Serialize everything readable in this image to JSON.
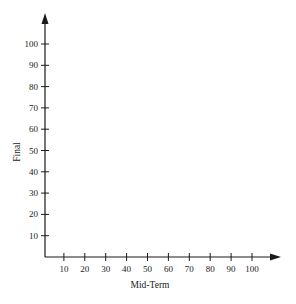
{
  "chart_data": {
    "type": "scatter",
    "title": "",
    "xlabel": "Mid-Term",
    "ylabel": "Final",
    "xlim": [
      0,
      110
    ],
    "ylim": [
      0,
      110
    ],
    "x_ticks": [
      10,
      20,
      30,
      40,
      50,
      60,
      70,
      80,
      90,
      100
    ],
    "y_ticks": [
      10,
      20,
      30,
      40,
      50,
      60,
      70,
      80,
      90,
      100
    ],
    "x_tick_labels": [
      "10",
      "20",
      "30",
      "40",
      "50",
      "60",
      "70",
      "80",
      "90",
      "100"
    ],
    "y_tick_labels": [
      "10",
      "20",
      "30",
      "40",
      "50",
      "60",
      "70",
      "80",
      "90",
      "100"
    ],
    "series": [],
    "grid": false,
    "legend": null,
    "axes_arrows": true
  },
  "colors": {
    "axis": "#1a1a1a",
    "background": "#ffffff"
  }
}
